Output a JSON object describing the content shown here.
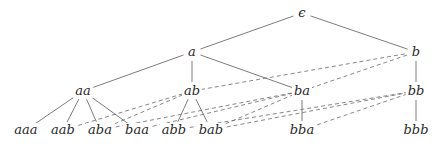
{
  "diagram": {
    "type": "tree-with-links",
    "nodes": [
      {
        "id": "eps",
        "label": "ϵ",
        "x": 302,
        "y": 13
      },
      {
        "id": "a",
        "label": "a",
        "x": 192,
        "y": 52
      },
      {
        "id": "b",
        "label": "b",
        "x": 416,
        "y": 52
      },
      {
        "id": "aa",
        "label": "aa",
        "x": 83,
        "y": 91
      },
      {
        "id": "ab",
        "label": "ab",
        "x": 192,
        "y": 91
      },
      {
        "id": "ba",
        "label": "ba",
        "x": 302,
        "y": 91
      },
      {
        "id": "bb",
        "label": "bb",
        "x": 416,
        "y": 91
      },
      {
        "id": "aaa",
        "label": "aaa",
        "x": 26,
        "y": 130
      },
      {
        "id": "aab",
        "label": "aab",
        "x": 63,
        "y": 130
      },
      {
        "id": "aba",
        "label": "aba",
        "x": 100,
        "y": 130
      },
      {
        "id": "baa",
        "label": "baa",
        "x": 137,
        "y": 130
      },
      {
        "id": "abb",
        "label": "abb",
        "x": 174,
        "y": 130
      },
      {
        "id": "bab",
        "label": "bab",
        "x": 211,
        "y": 130
      },
      {
        "id": "bba",
        "label": "bba",
        "x": 302,
        "y": 130
      },
      {
        "id": "bbb",
        "label": "bbb",
        "x": 416,
        "y": 130
      }
    ],
    "solid_edges": [
      [
        "eps",
        "a"
      ],
      [
        "eps",
        "b"
      ],
      [
        "a",
        "aa"
      ],
      [
        "a",
        "ab"
      ],
      [
        "a",
        "ba"
      ],
      [
        "b",
        "bb"
      ],
      [
        "aa",
        "aaa"
      ],
      [
        "aa",
        "aab"
      ],
      [
        "aa",
        "aba"
      ],
      [
        "aa",
        "baa"
      ],
      [
        "ab",
        "abb"
      ],
      [
        "ab",
        "bab"
      ],
      [
        "ba",
        "bba"
      ],
      [
        "bb",
        "bbb"
      ]
    ],
    "dashed_edges": [
      [
        "ab",
        "b"
      ],
      [
        "ba",
        "b"
      ],
      [
        "aab",
        "ab"
      ],
      [
        "aba",
        "ab"
      ],
      [
        "baa",
        "ba"
      ],
      [
        "aba",
        "ba"
      ],
      [
        "abb",
        "bb"
      ],
      [
        "bab",
        "ba"
      ],
      [
        "bab",
        "bb"
      ],
      [
        "bba",
        "bb"
      ]
    ],
    "colors": {
      "background": "#ffffff",
      "text": "#2a2a2a",
      "solid_line": "#5a5a5a",
      "dashed_line": "#6a6a6a"
    }
  }
}
